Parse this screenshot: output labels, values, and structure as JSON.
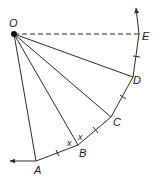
{
  "diagram": {
    "points": {
      "O": {
        "label": "O",
        "x": 14,
        "y": 34
      },
      "A": {
        "label": "A",
        "x": 36,
        "y": 161
      },
      "B": {
        "label": "B",
        "x": 78,
        "y": 145
      },
      "C": {
        "label": "C",
        "x": 111,
        "y": 117
      },
      "D": {
        "label": "D",
        "x": 133,
        "y": 77
      },
      "E": {
        "label": "E",
        "x": 139,
        "y": 34
      }
    },
    "angle_labels": [
      "x",
      "x"
    ],
    "colors": {
      "stroke": "#2a2a2a",
      "background": "#ffffff"
    }
  }
}
